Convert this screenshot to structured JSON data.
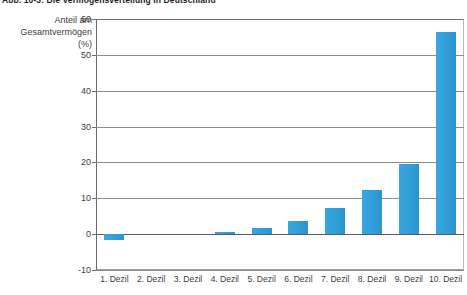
{
  "figure": {
    "title": "Abb. 10-3: Die Vermögensverteilung in Deutschland",
    "axis_caption_line1": "Anteil am",
    "axis_caption_line2": "Gesamtvermögen",
    "axis_caption_line3": "(%)",
    "bar_color": "#33a0da",
    "grid_color": "#8c8c8c",
    "axis_color": "#6d6d6d"
  },
  "chart_data": {
    "type": "bar",
    "title": "Abb. 10-3: Die Vermögensverteilung in Deutschland",
    "xlabel": "",
    "ylabel": "Anteil am Gesamtvermögen (%)",
    "ylim": [
      -10,
      60
    ],
    "yticks": [
      -10,
      0,
      10,
      20,
      30,
      40,
      50,
      60
    ],
    "ytick_labels": [
      "-10",
      "0",
      "10",
      "20",
      "30",
      "40",
      "50",
      "60"
    ],
    "grid": true,
    "legend": false,
    "categories": [
      "1. Dezil",
      "2. Dezil",
      "3. Dezil",
      "4. Dezil",
      "5. Dezil",
      "6. Dezil",
      "7. Dezil",
      "8. Dezil",
      "9. Dezil",
      "10. Dezil"
    ],
    "values": [
      -1.6,
      0,
      0,
      0.6,
      1.6,
      3.8,
      7.2,
      12.3,
      19.6,
      56.5
    ]
  }
}
